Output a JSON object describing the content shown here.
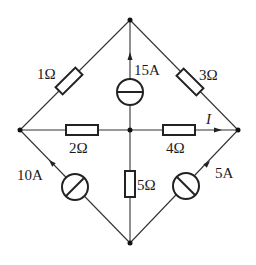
{
  "diagram": {
    "type": "circuit",
    "nodes": [
      {
        "id": "top",
        "x": 130,
        "y": 20
      },
      {
        "id": "left",
        "x": 20,
        "y": 130
      },
      {
        "id": "right",
        "x": 238,
        "y": 130
      },
      {
        "id": "bottom",
        "x": 130,
        "y": 243
      },
      {
        "id": "center",
        "x": 130,
        "y": 130
      }
    ],
    "components": [
      {
        "id": "R1",
        "kind": "resistor",
        "label": "1Ω",
        "between": [
          "left",
          "top"
        ]
      },
      {
        "id": "R3",
        "kind": "resistor",
        "label": "3Ω",
        "between": [
          "top",
          "right"
        ]
      },
      {
        "id": "R2",
        "kind": "resistor",
        "label": "2Ω",
        "between": [
          "left",
          "center"
        ]
      },
      {
        "id": "R4",
        "kind": "resistor",
        "label": "4Ω",
        "between": [
          "center",
          "right"
        ]
      },
      {
        "id": "R5",
        "kind": "resistor",
        "label": "5Ω",
        "between": [
          "center",
          "bottom"
        ]
      },
      {
        "id": "I15",
        "kind": "current-source",
        "label": "15A",
        "between": [
          "center",
          "top"
        ],
        "direction": "up"
      },
      {
        "id": "I10",
        "kind": "current-source",
        "label": "10A",
        "between": [
          "bottom",
          "left"
        ],
        "direction": "toward-left"
      },
      {
        "id": "I5",
        "kind": "current-source",
        "label": "5A",
        "between": [
          "bottom",
          "right"
        ],
        "direction": "toward-right"
      }
    ],
    "annotations": [
      {
        "id": "I",
        "label": "I",
        "description": "current in 4Ω branch toward right node"
      }
    ]
  },
  "labels": {
    "r1": "1Ω",
    "r3": "3Ω",
    "r2": "2Ω",
    "r4": "4Ω",
    "r5": "5Ω",
    "i15": "15A",
    "i10": "10A",
    "i5": "5A",
    "current": "I"
  }
}
